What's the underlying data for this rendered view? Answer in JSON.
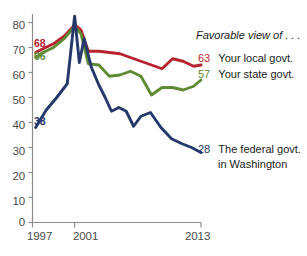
{
  "chart_data": {
    "type": "line",
    "title": "Favorable view of . . .",
    "xlabel": "",
    "ylabel": "",
    "ylim": [
      0,
      80
    ],
    "xlim": [
      1997,
      2013
    ],
    "grid": false,
    "legend_position": "right",
    "yticks": [
      "0",
      "10",
      "20",
      "30",
      "40",
      "50",
      "60",
      "70",
      "80"
    ],
    "ytick_values": [
      0,
      10,
      20,
      30,
      40,
      50,
      60,
      70,
      80
    ],
    "xticks": [
      "1997",
      "2001",
      "2013"
    ],
    "xtick_values": [
      1997,
      2001,
      2013
    ],
    "series": [
      {
        "name": "Your local govt.",
        "color": "#b5232e",
        "start_label": "68",
        "end_label": "63",
        "start_value": 68,
        "end_value": 63,
        "x": [
          1997.3,
          1998,
          1999,
          2000,
          2001,
          2001.6,
          2002.3,
          2003.3,
          2004.3,
          2005.3,
          2006.3,
          2007.3,
          2008.3,
          2009.3,
          2010.3,
          2011.3,
          2012.3,
          2013
        ],
        "values": [
          68,
          69.5,
          71.5,
          74.5,
          79,
          77,
          68.5,
          68.5,
          68,
          67.5,
          66,
          64.5,
          63,
          61.5,
          65.5,
          64.5,
          62.5,
          63
        ]
      },
      {
        "name": "Your state govt.",
        "color": "#5f8a34",
        "start_label": "66",
        "end_label": "57",
        "start_value": 66,
        "end_value": 57,
        "x": [
          1997.3,
          1998,
          1999,
          2000,
          2001,
          2001.6,
          2002.3,
          2003.3,
          2004.3,
          2005.3,
          2006.3,
          2007.3,
          2008.3,
          2009.3,
          2010.3,
          2011.3,
          2012.3,
          2013
        ],
        "values": [
          66,
          68,
          70,
          73.5,
          78.5,
          75.5,
          63.5,
          63,
          58.5,
          59,
          60.5,
          58.5,
          51,
          54,
          54,
          53,
          54.5,
          57
        ]
      },
      {
        "name_line1": "The federal govt.",
        "name_line2": "in Washington",
        "name": "The federal govt. in Washington",
        "color": "#24386b",
        "start_label": "38",
        "end_label": "28",
        "start_value": 38,
        "end_value": 28,
        "x": [
          1997.3,
          1998.3,
          1999.3,
          2000.3,
          2001,
          2001.45,
          2001.9,
          2002.6,
          2003.3,
          2003.9,
          2004.5,
          2005.2,
          2005.9,
          2006.6,
          2007.3,
          2008.2,
          2009.2,
          2010.2,
          2011.2,
          2012.1,
          2013
        ],
        "values": [
          38,
          45,
          50,
          55.5,
          82.5,
          64,
          73.5,
          62,
          55,
          50,
          44.5,
          46,
          44.5,
          38.5,
          42.5,
          44,
          38,
          33.5,
          31.5,
          30,
          28
        ]
      }
    ]
  },
  "axis": {
    "y_ticks": [
      {
        "label": "80"
      },
      {
        "label": "70"
      },
      {
        "label": "60"
      },
      {
        "label": "50"
      },
      {
        "label": "40"
      },
      {
        "label": "30"
      },
      {
        "label": "20"
      },
      {
        "label": "10"
      },
      {
        "label": "0"
      }
    ],
    "x_ticks": [
      {
        "label": "1997"
      },
      {
        "label": "2001"
      },
      {
        "label": "2013"
      }
    ]
  },
  "legend": {
    "title": "Favorable view of . . .",
    "entries": [
      {
        "value": "63",
        "label": "Your local govt.",
        "color": "#b5232e"
      },
      {
        "value": "57",
        "label": "Your state govt.",
        "color": "#5f8a34"
      },
      {
        "value": "28",
        "label_line1": "The federal govt.",
        "label_line2": "in Washington",
        "color": "#24386b"
      }
    ]
  },
  "start_labels": [
    {
      "value": "68",
      "color": "#b5232e"
    },
    {
      "value": "66",
      "color": "#5f8a34"
    },
    {
      "value": "38",
      "color": "#24386b"
    }
  ]
}
